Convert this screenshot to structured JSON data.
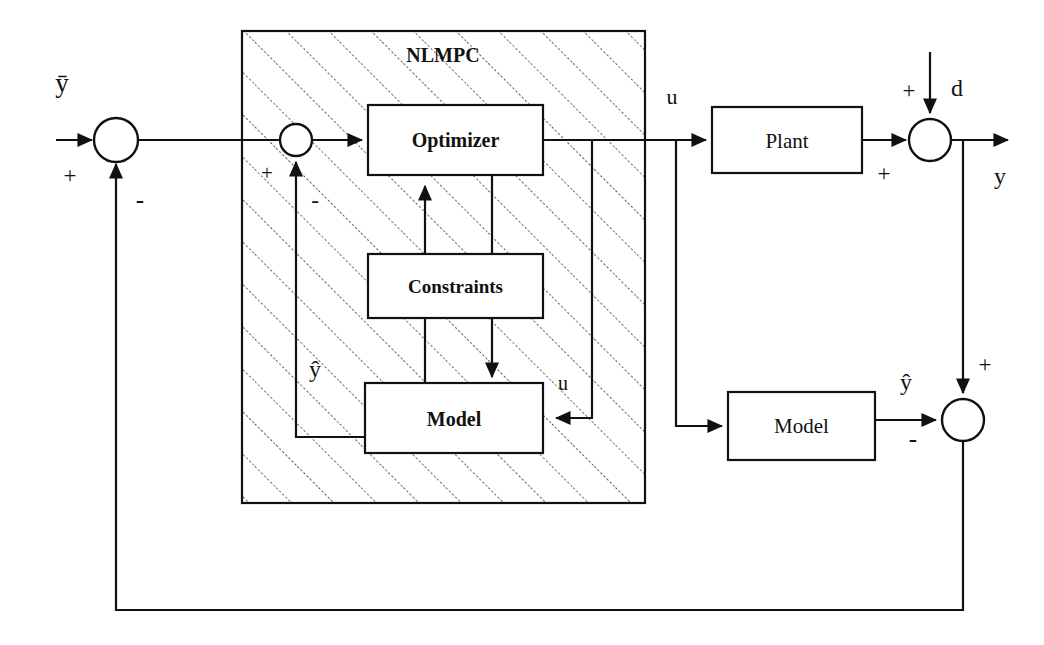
{
  "diagram": {
    "type": "control-block-diagram",
    "canvas": {
      "width": 1044,
      "height": 645
    },
    "colors": {
      "line": "#111111",
      "background": "#ffffff",
      "hatch": "#333333"
    }
  },
  "controller": {
    "name": "NLMPC",
    "hatched": true,
    "bounds": {
      "x": 242,
      "y": 31,
      "width": 403,
      "height": 472
    }
  },
  "blocks": [
    {
      "id": "optimizer",
      "label": "Optimizer",
      "bold": true,
      "bounds": {
        "x": 368,
        "y": 105,
        "width": 175,
        "height": 70
      }
    },
    {
      "id": "constraints",
      "label": "Constraints",
      "bold": true,
      "bounds": {
        "x": 368,
        "y": 254,
        "width": 175,
        "height": 64
      }
    },
    {
      "id": "inner-model",
      "label": "Model",
      "bold": true,
      "bounds": {
        "x": 365,
        "y": 383,
        "width": 178,
        "height": 70
      }
    },
    {
      "id": "plant",
      "label": "Plant",
      "bold": false,
      "bounds": {
        "x": 712,
        "y": 107,
        "width": 150,
        "height": 66
      }
    },
    {
      "id": "outer-model",
      "label": "Model",
      "bold": false,
      "bounds": {
        "x": 728,
        "y": 392,
        "width": 147,
        "height": 68
      }
    }
  ],
  "summing_junctions": [
    {
      "id": "setpoint-sum",
      "cx": 116,
      "cy": 140,
      "r": 22
    },
    {
      "id": "inner-sum",
      "cx": 296,
      "cy": 140,
      "r": 16
    },
    {
      "id": "disturbance-sum",
      "cx": 930,
      "cy": 140,
      "r": 21
    },
    {
      "id": "error-sum",
      "cx": 963,
      "cy": 420,
      "r": 21
    }
  ],
  "signals": {
    "setpoint": "ȳ",
    "setpoint_plain": "y",
    "control": "u",
    "control_inner": "u",
    "disturbance": "d",
    "output": "y",
    "model_output": "ŷ",
    "model_output_inner": "ŷ"
  },
  "signs": {
    "setpoint_plus": "+",
    "setpoint_minus": "-",
    "inner_plus": "+",
    "inner_minus": "-",
    "disturbance_plus": "+",
    "plant_plus": "+",
    "error_plus": "+",
    "error_minus": "-"
  }
}
